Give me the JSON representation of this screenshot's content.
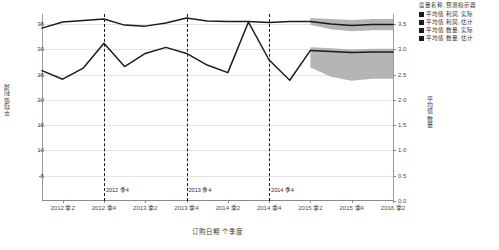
{
  "chart_data": {
    "type": "line",
    "title": "",
    "xlabel": "订购日期 个季度",
    "ylabel_left": "平均值 利润",
    "ylabel_right": "平均值 数量",
    "grid": true,
    "legend_position": "right",
    "legend_title": "度量名称, 预测指示器",
    "x": [
      "2012 季1",
      "2012 季2",
      "2012 季3",
      "2012 季4",
      "2013 季1",
      "2013 季2",
      "2013 季3",
      "2013 季4",
      "2014 季1",
      "2014 季2",
      "2014 季3",
      "2014 季4",
      "2015 季1",
      "2015 季2",
      "2015 季3",
      "2015 季4",
      "2016 季1",
      "2016 季2"
    ],
    "xticks": [
      "2012 季2",
      "2012 季4",
      "2013 季2",
      "2013 季4",
      "2014 季2",
      "2014 季4",
      "2015 季2",
      "2015 季4",
      "2016 季2"
    ],
    "ylim_left": [
      0,
      37
    ],
    "yticks_left": [
      "5",
      "10",
      "15",
      "20",
      "25",
      "30",
      "35"
    ],
    "ylim_right": [
      0,
      3.7
    ],
    "yticks_right": [
      "0.0",
      "0.5",
      "1.0",
      "1.5",
      "2.0",
      "2.5",
      "3.0",
      "3.5"
    ],
    "reference_lines": [
      {
        "label": "2012 季4",
        "x": "2012 季4"
      },
      {
        "label": "2013 季4",
        "x": "2013 季4"
      },
      {
        "label": "2014 季4",
        "x": "2014 季4"
      }
    ],
    "series": [
      {
        "name": "平均值 利润, 实际",
        "axis": "left",
        "color": "#1b1b1b",
        "values": [
          25.8,
          24.1,
          26.3,
          31.2,
          26.6,
          29.2,
          30.4,
          29.2,
          26.9,
          25.4,
          35.4,
          27.9,
          23.9,
          29.8,
          null,
          null,
          null,
          null
        ]
      },
      {
        "name": "平均值 利润, 估计",
        "axis": "left",
        "color": "#1b1b1b",
        "values": [
          null,
          null,
          null,
          null,
          null,
          null,
          null,
          null,
          null,
          null,
          null,
          null,
          null,
          29.8,
          29.6,
          29.4,
          29.5,
          29.5
        ]
      },
      {
        "name": "平均值 数量, 实际",
        "axis": "right",
        "color": "#1b1b1b",
        "values": [
          3.42,
          3.54,
          3.57,
          3.6,
          3.48,
          3.46,
          3.52,
          3.62,
          3.56,
          3.55,
          3.55,
          3.53,
          3.55,
          3.55,
          null,
          null,
          null,
          null
        ]
      },
      {
        "name": "平均值 数量, 估计",
        "axis": "right",
        "color": "#1b1b1b",
        "values": [
          null,
          null,
          null,
          null,
          null,
          null,
          null,
          null,
          null,
          null,
          null,
          null,
          null,
          3.55,
          3.5,
          3.47,
          3.49,
          3.49
        ]
      }
    ],
    "forecast_bands": [
      {
        "for_series": "平均值 数量, 估计",
        "color": "#a8a8a8",
        "upper": [
          3.62,
          3.6,
          3.58,
          3.6,
          3.6
        ],
        "lower": [
          3.48,
          3.4,
          3.36,
          3.38,
          3.38
        ]
      },
      {
        "for_series": "平均值 利润, 估计",
        "color": "#a8a8a8",
        "upper": [
          30.4,
          30.2,
          30.0,
          30.1,
          30.1
        ],
        "lower": [
          26.4,
          24.6,
          23.8,
          24.2,
          24.2
        ]
      }
    ]
  },
  "legend": {
    "title": "度量名称, 预测指示器",
    "items": [
      {
        "label": "平均值 利润, 实际",
        "color": "#1b1b1b"
      },
      {
        "label": "平均值 利润, 估计",
        "color": "#1b1b1b"
      },
      {
        "label": "平均值 数量, 实际",
        "color": "#1b1b1b"
      },
      {
        "label": "平均值 数量, 估计",
        "color": "#1b1b1b"
      }
    ]
  }
}
